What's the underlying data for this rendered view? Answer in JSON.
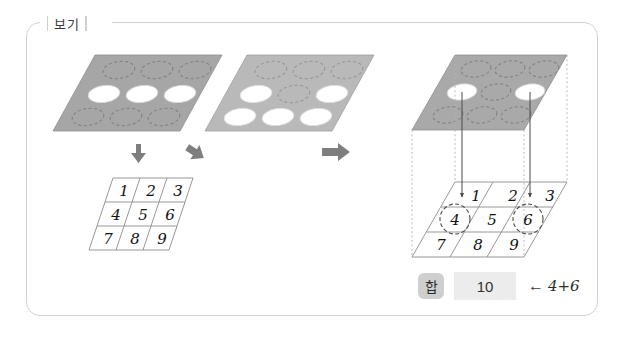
{
  "frame": {
    "label": "보기"
  },
  "colors": {
    "frame_border": "#d2d2d2",
    "plate_left_fill": "#a6a6a6",
    "plate_right_fill": "#b9b9b9",
    "plate_top_fill": "#a9a9a9",
    "hole_fill": "#ffffff",
    "dashed_stroke": "#8e8e8e",
    "arrow_gray": "#7e7e7e",
    "grid_stroke": "#9a9a9a",
    "number_ink": "#1a1a1a",
    "chip_bg": "#cfcfcf",
    "value_bg": "#ececec",
    "projection_line": "#b0b0b0"
  },
  "plates": [
    {
      "name": "plate-left",
      "fill": "#a6a6a6",
      "holes": [
        [
          "dashed",
          "dashed",
          "dashed"
        ],
        [
          "open",
          "open",
          "open"
        ],
        [
          "dashed",
          "dashed",
          "dashed"
        ]
      ]
    },
    {
      "name": "plate-right",
      "fill": "#b9b9b9",
      "holes": [
        [
          "dashed",
          "dashed",
          "dashed"
        ],
        [
          "open",
          "dashed",
          "open"
        ],
        [
          "open",
          "open",
          "open"
        ]
      ]
    },
    {
      "name": "plate-result-top",
      "fill": "#a9a9a9",
      "holes": [
        [
          "dashed",
          "dashed",
          "dashed"
        ],
        [
          "open",
          "dashed",
          "open"
        ],
        [
          "dashed",
          "dashed",
          "dashed"
        ]
      ]
    }
  ],
  "arrows": {
    "down_label": "arrow-down",
    "diagonal_label": "arrow-down-left",
    "transform_label": "arrow-right"
  },
  "grid_left": {
    "name": "number-grid-source",
    "rows": [
      [
        "1",
        "2",
        "3"
      ],
      [
        "4",
        "5",
        "6"
      ],
      [
        "7",
        "8",
        "9"
      ]
    ],
    "circled": []
  },
  "grid_right": {
    "name": "number-grid-result",
    "rows": [
      [
        "1",
        "2",
        "3"
      ],
      [
        "4",
        "5",
        "6"
      ],
      [
        "7",
        "8",
        "9"
      ]
    ],
    "circled": [
      "4",
      "6"
    ]
  },
  "sum": {
    "label": "합",
    "value": "10",
    "arrow": "←",
    "expression": "4+6"
  }
}
